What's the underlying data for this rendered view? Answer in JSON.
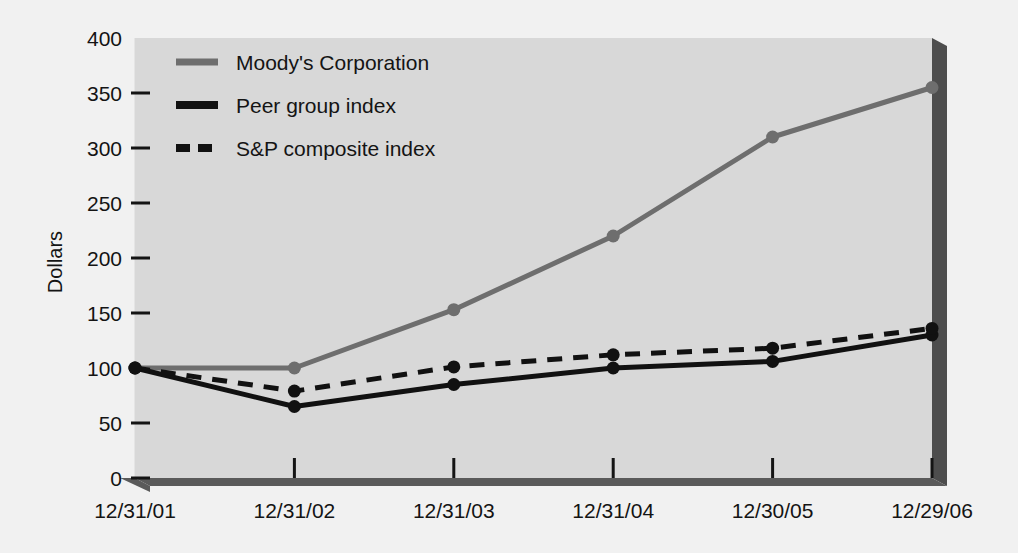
{
  "chart_data": {
    "type": "line",
    "title": "",
    "subtitle": "",
    "xlabel": "",
    "ylabel": "Dollars",
    "categories": [
      "12/31/01",
      "12/31/02",
      "12/31/03",
      "12/31/04",
      "12/30/05",
      "12/29/06"
    ],
    "x_tick_labels": [
      "12/31/01",
      "12/31/02",
      "12/31/03",
      "12/31/04",
      "12/30/05",
      "12/29/06"
    ],
    "y_tick_labels": [
      "400",
      "350",
      "300",
      "250",
      "200",
      "150",
      "100",
      "50",
      "0"
    ],
    "y_ticks": [
      400,
      350,
      300,
      250,
      200,
      150,
      100,
      50,
      0
    ],
    "ylim": [
      0,
      400
    ],
    "grid": false,
    "legend_position": "top-left-inside",
    "series": [
      {
        "name": "Moody's Corporation",
        "values": [
          100,
          100,
          153,
          220,
          310,
          355
        ],
        "color": "#6e6e6e",
        "style": "solid",
        "markers": true
      },
      {
        "name": "Peer group index",
        "values": [
          100,
          65,
          85,
          100,
          106,
          130
        ],
        "color": "#111111",
        "style": "solid",
        "markers": true
      },
      {
        "name": "S&P composite index",
        "values": [
          100,
          79,
          101,
          112,
          118,
          136
        ],
        "color": "#111111",
        "style": "dashed",
        "markers": true
      }
    ]
  },
  "legend": {
    "items": [
      {
        "label": "Moody's Corporation",
        "swatch": "solid-gray"
      },
      {
        "label": "Peer group index",
        "swatch": "solid-black"
      },
      {
        "label": "S&P composite index",
        "swatch": "dashed-black"
      }
    ]
  },
  "axes": {
    "y_title": "Dollars",
    "y_labels": [
      "400",
      "350",
      "300",
      "250",
      "200",
      "150",
      "100",
      "50",
      "0"
    ],
    "x_labels": [
      "12/31/01",
      "12/31/02",
      "12/31/03",
      "12/31/04",
      "12/30/05",
      "12/29/06"
    ]
  },
  "colors": {
    "page_background": "#f1f1f1",
    "plot_background": "#d8d8d8",
    "base_shadow": "#5a5a5a",
    "wall_shadow": "#4d4d4d",
    "moodys_line": "#6e6e6e",
    "index_line": "#111111",
    "text": "#141414"
  }
}
